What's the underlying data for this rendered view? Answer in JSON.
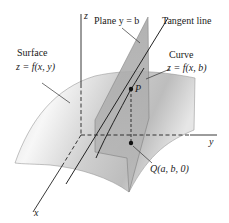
{
  "figure": {
    "labels": {
      "z_axis": "z",
      "y_axis": "y",
      "x_axis": "x",
      "plane_title": "Plane y = b",
      "tangent": "Tangent line",
      "curve_title": "Curve",
      "curve_eq": "z = f(x, b)",
      "surface_title": "Surface",
      "surface_eq": "z = f(x, y)",
      "point_p": "P",
      "point_q": "Q(a, b, 0)"
    },
    "colors": {
      "surface_light": "#f2f2f2",
      "surface_dark": "#b8b8b8",
      "plane": "#9a9a9a",
      "line": "#222222"
    }
  }
}
